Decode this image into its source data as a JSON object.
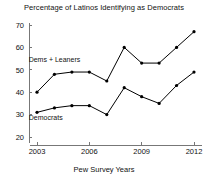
{
  "chart_data": {
    "type": "line",
    "title": "Percentage of Latinos Identifying as Democrats",
    "xlabel": "Pew Survey Years",
    "ylabel": "",
    "x": [
      2003,
      2004,
      2005,
      2006,
      2007,
      2008,
      2009,
      2010,
      2011,
      2012
    ],
    "xlim": [
      2002.6,
      2012.6
    ],
    "ylim": [
      18,
      72
    ],
    "xticks": [
      2003,
      2006,
      2009,
      2012
    ],
    "xtick_labels": [
      "2003",
      "2006",
      "2009",
      "2012"
    ],
    "yticks": [
      20,
      30,
      40,
      50,
      60,
      70
    ],
    "ytick_labels": [
      "20",
      "30",
      "40",
      "50",
      "60",
      "70"
    ],
    "grid": false,
    "legend_position": "inline-annotations",
    "series": [
      {
        "name": "Dems + Leaners",
        "values": [
          40,
          48,
          49,
          49,
          45,
          60,
          53,
          53,
          60,
          67
        ],
        "color": "#000000",
        "label_x": 2004.0,
        "label_y": 53.5
      },
      {
        "name": "Democrats",
        "values": [
          31,
          33,
          34,
          34,
          30,
          42,
          38,
          35,
          43,
          49
        ],
        "color": "#000000",
        "label_x": 2003.5,
        "label_y": 27.5
      }
    ]
  },
  "annotations": {
    "upper_series_label": "Dems + Leaners",
    "lower_series_label": "Democrats"
  },
  "colors": {
    "background": "#ffffff",
    "axis": "#777777",
    "line": "#000000",
    "text": "#111111"
  }
}
